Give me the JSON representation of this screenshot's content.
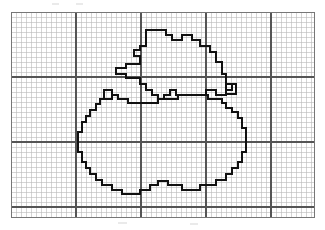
{
  "figure": {
    "kind": "scanned-line-figure",
    "background_color": "#ffffff"
  },
  "grid": {
    "origin_x": 11,
    "origin_y": 12,
    "width": 303,
    "height": 205,
    "cell_size": 5,
    "minor_color": "#b9b9b9",
    "minor_width": 0.6,
    "major_color": "#555555",
    "major_width": 1.2,
    "major_every_cells": 13,
    "border_color": "#777777",
    "border_width": 1.0,
    "columns": 60,
    "rows": 41,
    "major_vertical_x": [
      76,
      141,
      206,
      271
    ],
    "major_horizontal_y": [
      77,
      142,
      207
    ]
  },
  "contour": {
    "stroke_color": "#111111",
    "stroke_width": 2.0,
    "stroke_join": "miter",
    "description": "Bold staircase polyline tracing a pixelated apple body with a leaf and stem above",
    "shapes": [
      {
        "name": "apple-body",
        "closed": true,
        "points": [
          [
            104,
            95
          ],
          [
            104,
            90
          ],
          [
            112,
            90
          ],
          [
            112,
            95
          ],
          [
            118,
            95
          ],
          [
            118,
            99
          ],
          [
            128,
            99
          ],
          [
            128,
            103
          ],
          [
            158,
            103
          ],
          [
            158,
            99
          ],
          [
            178,
            99
          ],
          [
            178,
            95
          ],
          [
            208,
            95
          ],
          [
            208,
            99
          ],
          [
            222,
            99
          ],
          [
            222,
            103
          ],
          [
            226,
            103
          ],
          [
            226,
            108
          ],
          [
            232,
            108
          ],
          [
            232,
            112
          ],
          [
            238,
            112
          ],
          [
            238,
            118
          ],
          [
            242,
            118
          ],
          [
            242,
            128
          ],
          [
            246,
            128
          ],
          [
            246,
            152
          ],
          [
            242,
            152
          ],
          [
            242,
            162
          ],
          [
            238,
            162
          ],
          [
            238,
            168
          ],
          [
            232,
            168
          ],
          [
            232,
            174
          ],
          [
            226,
            174
          ],
          [
            226,
            180
          ],
          [
            216,
            180
          ],
          [
            216,
            185
          ],
          [
            200,
            185
          ],
          [
            200,
            190
          ],
          [
            182,
            190
          ],
          [
            182,
            185
          ],
          [
            168,
            185
          ],
          [
            168,
            181
          ],
          [
            158,
            181
          ],
          [
            158,
            185
          ],
          [
            150,
            185
          ],
          [
            150,
            190
          ],
          [
            140,
            190
          ],
          [
            140,
            194
          ],
          [
            122,
            194
          ],
          [
            122,
            190
          ],
          [
            112,
            190
          ],
          [
            112,
            185
          ],
          [
            102,
            185
          ],
          [
            102,
            180
          ],
          [
            96,
            180
          ],
          [
            96,
            174
          ],
          [
            90,
            174
          ],
          [
            90,
            168
          ],
          [
            86,
            168
          ],
          [
            86,
            162
          ],
          [
            82,
            162
          ],
          [
            82,
            152
          ],
          [
            78,
            152
          ],
          [
            78,
            132
          ],
          [
            82,
            132
          ],
          [
            82,
            122
          ],
          [
            86,
            122
          ],
          [
            86,
            116
          ],
          [
            90,
            116
          ],
          [
            90,
            110
          ],
          [
            96,
            110
          ],
          [
            96,
            104
          ],
          [
            100,
            104
          ],
          [
            100,
            99
          ],
          [
            104,
            99
          ]
        ]
      },
      {
        "name": "apple-leaf",
        "closed": true,
        "points": [
          [
            146,
            30
          ],
          [
            166,
            30
          ],
          [
            166,
            35
          ],
          [
            172,
            35
          ],
          [
            172,
            40
          ],
          [
            182,
            40
          ],
          [
            182,
            35
          ],
          [
            192,
            35
          ],
          [
            192,
            40
          ],
          [
            200,
            40
          ],
          [
            200,
            46
          ],
          [
            210,
            46
          ],
          [
            210,
            52
          ],
          [
            216,
            52
          ],
          [
            216,
            62
          ],
          [
            222,
            62
          ],
          [
            222,
            74
          ],
          [
            226,
            74
          ],
          [
            226,
            84
          ],
          [
            232,
            84
          ],
          [
            232,
            90
          ],
          [
            226,
            90
          ],
          [
            226,
            95
          ],
          [
            216,
            95
          ],
          [
            216,
            90
          ],
          [
            206,
            90
          ],
          [
            206,
            95
          ],
          [
            176,
            95
          ],
          [
            176,
            90
          ],
          [
            170,
            90
          ],
          [
            170,
            95
          ],
          [
            164,
            95
          ],
          [
            164,
            99
          ],
          [
            158,
            99
          ],
          [
            158,
            95
          ],
          [
            152,
            95
          ],
          [
            152,
            90
          ],
          [
            146,
            90
          ],
          [
            146,
            84
          ],
          [
            140,
            84
          ],
          [
            140,
            78
          ],
          [
            126,
            78
          ],
          [
            126,
            74
          ],
          [
            116,
            74
          ],
          [
            116,
            68
          ],
          [
            126,
            68
          ],
          [
            126,
            64
          ],
          [
            140,
            64
          ],
          [
            140,
            56
          ],
          [
            134,
            56
          ],
          [
            134,
            50
          ],
          [
            140,
            50
          ],
          [
            140,
            46
          ],
          [
            146,
            46
          ]
        ]
      },
      {
        "name": "stem-left-notch",
        "closed": true,
        "points": [
          [
            104,
            90
          ],
          [
            112,
            90
          ],
          [
            112,
            99
          ],
          [
            104,
            99
          ]
        ]
      },
      {
        "name": "stem-right-notch",
        "closed": true,
        "points": [
          [
            226,
            84
          ],
          [
            236,
            84
          ],
          [
            236,
            94
          ],
          [
            226,
            94
          ]
        ]
      }
    ]
  },
  "artifacts": {
    "scan_marks": [
      {
        "x": 52,
        "y": 3,
        "w": 7,
        "h": 2
      },
      {
        "x": 76,
        "y": 3,
        "w": 7,
        "h": 2
      },
      {
        "x": 118,
        "y": 222,
        "w": 9,
        "h": 2
      },
      {
        "x": 190,
        "y": 223,
        "w": 8,
        "h": 2
      }
    ]
  }
}
